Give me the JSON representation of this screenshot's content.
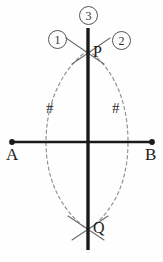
{
  "figure": {
    "background_color": "#fefefe",
    "width": 163,
    "height": 262
  },
  "colors": {
    "segment": "#1a1a1a",
    "bisector": "#1a1a1a",
    "arc": "#8a8a8a",
    "arc_solid": "#6e6e6e",
    "label": "#1a1a1a",
    "circle_stroke": "#555555"
  },
  "points": {
    "a": {
      "label": "A",
      "x": 12,
      "y": 142,
      "label_x": 7,
      "label_y": 148
    },
    "b": {
      "label": "B",
      "x": 152,
      "y": 142,
      "label_x": 146,
      "label_y": 148
    },
    "p": {
      "label": "P",
      "x": 88,
      "y": 52,
      "label_x": 94,
      "label_y": 46
    },
    "q": {
      "label": "Q",
      "x": 88,
      "y": 228,
      "label_x": 94,
      "label_y": 222
    }
  },
  "steps": [
    {
      "label": "1",
      "glyph": "1",
      "x": 48,
      "y": 30
    },
    {
      "label": "2",
      "glyph": "2",
      "x": 112,
      "y": 31
    },
    {
      "label": "3",
      "glyph": "3",
      "x": 79,
      "y": 6
    }
  ],
  "tick_marks": [
    {
      "label": "#",
      "x": 46,
      "y": 101,
      "side": "left"
    },
    {
      "label": "#",
      "x": 112,
      "y": 101,
      "side": "right"
    }
  ],
  "segment_ab": {
    "name": "AB",
    "x1": 12,
    "y1": 142,
    "x2": 152,
    "y2": 142,
    "stroke_width": 2.6
  },
  "bisector_line": {
    "name": "PQ",
    "x1": 88,
    "y1": 28,
    "x2": 88,
    "y2": 250,
    "stroke_width": 3.4
  },
  "arc_left": {
    "center": "A",
    "description": "dashed compass arc centered at A through P and Q",
    "path": "M 88 50 C 58 72, 46 108, 46 142 C 46 176, 58 208, 88 230"
  },
  "arc_right": {
    "center": "B",
    "description": "dashed compass arc centered at B through P and Q",
    "path": "M 88 50 C 118 72, 128 108, 128 142 C 128 176, 118 208, 88 230"
  },
  "arc_crossings": {
    "top": [
      {
        "name": "arc-left-over-p",
        "path": "M 66 38 L 104 64"
      },
      {
        "name": "arc-right-over-p",
        "path": "M 110 38 L 72 64"
      }
    ],
    "bottom": [
      {
        "name": "arc-left-over-q",
        "path": "M 68 216 L 104 240"
      },
      {
        "name": "arc-right-over-q",
        "path": "M 108 216 L 72 240"
      }
    ]
  }
}
